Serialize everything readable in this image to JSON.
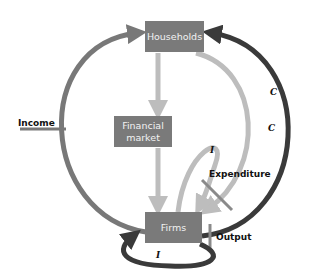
{
  "diagram": {
    "type": "circular-flow",
    "nodes": {
      "households": {
        "label": "Households"
      },
      "financial_market": {
        "label_line1": "Financial",
        "label_line2": "market"
      },
      "firms": {
        "label": "Firms"
      }
    },
    "flow_labels": {
      "income": "Income",
      "expenditure": "Expenditure",
      "output": "Output",
      "consumption_outer": "C",
      "consumption_inner": "C",
      "investment_inner": "I",
      "investment_bottom": "I"
    },
    "colors": {
      "box": "#7a7a7a",
      "box_text": "#f2f2f2",
      "income_arc": "#787878",
      "consumption_dark_arc": "#3a3a3a",
      "light_arc": "#bdbdbd",
      "label_text": "#111111"
    }
  }
}
